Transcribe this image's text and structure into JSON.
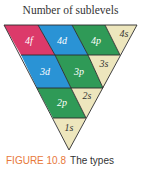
{
  "figure": {
    "title": "Number of sublevels",
    "caption_label": "FIGURE 10.8",
    "caption_text": "The types"
  },
  "colors": {
    "f": "#dc3a6a",
    "d": "#2a93d5",
    "p": "#2f9a57",
    "s": "#ede6bd",
    "outline": "#2b2b2b",
    "label_light": "#ffffff",
    "label_dark": "#333333"
  },
  "rows": [
    {
      "level": 4,
      "sublevels": [
        "4f",
        "4d",
        "4p",
        "4s"
      ]
    },
    {
      "level": 3,
      "sublevels": [
        "3d",
        "3p",
        "3s"
      ]
    },
    {
      "level": 2,
      "sublevels": [
        "2p",
        "2s"
      ]
    },
    {
      "level": 1,
      "sublevels": [
        "1s"
      ]
    }
  ],
  "labels": {
    "l4f": "4f",
    "l4d": "4d",
    "l4p": "4p",
    "l4s": "4s",
    "l3d": "3d",
    "l3p": "3p",
    "l3s": "3s",
    "l2p": "2p",
    "l2s": "2s",
    "l1s": "1s"
  }
}
